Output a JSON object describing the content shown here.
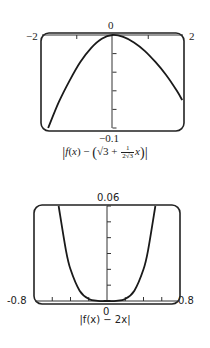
{
  "chart_data": [
    {
      "type": "line",
      "title": "",
      "caption": "|f(x) − (√3 + (1/(2√3)) x)|",
      "xlabel": "",
      "ylabel": "",
      "xlim": [
        -2,
        2
      ],
      "ylim": [
        -0.1,
        0
      ],
      "x_tick_labels": [
        "-2",
        "0",
        "2"
      ],
      "y_tick_labels": [
        "0",
        "-0.1"
      ],
      "x_ticks": [
        -2,
        -1,
        0,
        1,
        2
      ],
      "y_ticks": [
        0,
        -0.02,
        -0.04,
        -0.06,
        -0.08,
        -0.1
      ],
      "grid": false,
      "series": [
        {
          "name": "error",
          "x": [
            -1.8,
            -1.5,
            -1.2,
            -0.9,
            -0.6,
            -0.3,
            0,
            0.3,
            0.6,
            0.9,
            1.2,
            1.5,
            1.8,
            1.95
          ],
          "y": [
            -0.1,
            -0.072,
            -0.049,
            -0.029,
            -0.014,
            -0.004,
            0,
            -0.002,
            -0.008,
            -0.017,
            -0.029,
            -0.043,
            -0.06,
            -0.07
          ]
        }
      ]
    },
    {
      "type": "line",
      "title": "",
      "caption": "|f(x) − 2x|",
      "xlabel": "",
      "ylabel": "",
      "xlim": [
        -0.8,
        0.8
      ],
      "ylim": [
        0,
        0.06
      ],
      "x_tick_labels": [
        "-0.8",
        "0",
        "0.8"
      ],
      "y_tick_labels": [
        "0.06"
      ],
      "x_ticks": [
        -0.8,
        -0.6,
        -0.4,
        -0.2,
        0,
        0.2,
        0.4,
        0.6,
        0.8
      ],
      "y_ticks": [
        0,
        0.01,
        0.02,
        0.03,
        0.04,
        0.05,
        0.06
      ],
      "grid": false,
      "series": [
        {
          "name": "error",
          "x": [
            -0.53,
            -0.45,
            -0.4,
            -0.3,
            -0.2,
            -0.1,
            0,
            0.1,
            0.2,
            0.3,
            0.4,
            0.45,
            0.53
          ],
          "y": [
            0.06,
            0.032,
            0.02,
            0.0065,
            0.0013,
            0.0001,
            0,
            0.0001,
            0.0013,
            0.0065,
            0.02,
            0.032,
            0.06
          ]
        }
      ]
    }
  ],
  "fig1": {
    "xmin_label": "−2",
    "xmax_label": "2",
    "ymax_label": "0",
    "ymin_label": "−0.1",
    "caption": {
      "f": "f",
      "x": "x",
      "minus": "−",
      "sqrt3": "√3",
      "plus": "+",
      "frac_num": "1",
      "frac_den": "2√3",
      "x2": "x"
    }
  },
  "fig2": {
    "xmin_label": "-0.8",
    "xmax_label": "0.8",
    "ymax_label": "0.06",
    "origin_label": "0",
    "caption": "|f(x) − 2x|"
  },
  "colors": {
    "frame": "#222222",
    "curve": "#1a1a1a",
    "axis": "#333333",
    "background": "#ffffff"
  }
}
